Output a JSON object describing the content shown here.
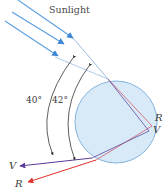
{
  "diagram": {
    "title": "Sunlight",
    "angles": [
      {
        "label": "40°",
        "value": 40
      },
      {
        "label": "42°",
        "value": 42
      }
    ],
    "rays": {
      "incoming_count": 3,
      "exit_labels_right": {
        "red": "R",
        "violet": "V"
      },
      "exit_labels_left": {
        "violet": "V",
        "red": "R"
      }
    },
    "colors": {
      "sunlight": "#4a90d9",
      "droplet_fill": "#d6e9f7",
      "droplet_stroke": "#7fb0dc",
      "red_ray": "#e0302a",
      "violet_ray": "#5a3a9a",
      "arc": "#333333"
    }
  }
}
